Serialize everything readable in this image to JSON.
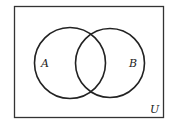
{
  "diagram": {
    "type": "venn",
    "universe_label": "U",
    "sets": [
      {
        "label": "A"
      },
      {
        "label": "B"
      }
    ],
    "colors": {
      "stroke": "#222222",
      "background": "#ffffff"
    }
  }
}
